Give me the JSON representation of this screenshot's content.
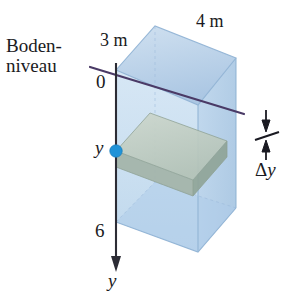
{
  "figure": {
    "labels": {
      "ground_level_line1": "Boden-",
      "ground_level_line2": "niveau",
      "width_label": "3 m",
      "length_label": "4 m",
      "axis_origin": "0",
      "depth_marker": "y",
      "axis_bottom_tick": "6",
      "axis_name": "y",
      "slab_thickness_delta": "Δ",
      "slab_thickness_var": "y"
    },
    "colors": {
      "tank_fill": "#bcd4ea",
      "tank_fill_front": "#cadef0",
      "tank_fill_top": "#b3cce6",
      "tank_edge": "#8fb2d4",
      "slab_top": "#c2cec3",
      "slab_front": "#a7b6ab",
      "slab_side": "#94a89b",
      "ground_line": "#4a3a66",
      "axis_line": "#2c2c35",
      "point_marker": "#1f93d8",
      "text": "#1a1a22"
    },
    "geometry": {
      "axis_top_y": 68,
      "axis_bottom_y": 272,
      "axis_x": 116,
      "point_marker_y": 151,
      "tank_top_front_left": [
        116,
        70
      ],
      "tank_top_back": [
        155,
        26
      ],
      "tank_top_back_right": [
        236,
        58
      ],
      "tank_top_front_right": [
        198,
        105
      ],
      "tank_bottom_front_left": [
        116,
        222
      ],
      "tank_bottom_front_right": [
        198,
        252
      ],
      "tank_bottom_back_right": [
        236,
        208
      ],
      "slab_depth_top": 131,
      "slab_depth_bottom": 152
    }
  }
}
